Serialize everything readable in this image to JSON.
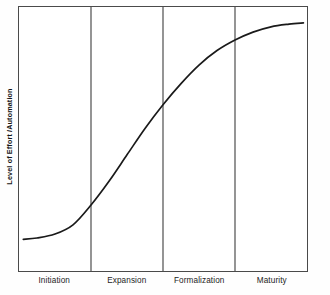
{
  "chart_data": {
    "type": "line",
    "title": "",
    "subtitle": "",
    "xlabel": "",
    "ylabel": "Level of Effort /Automation",
    "grid": false,
    "legend": "none",
    "xlim": [
      0,
      4
    ],
    "ylim": [
      0,
      1
    ],
    "axis_ticks": "none",
    "categories": [
      "Initiation",
      "Expansion",
      "Formalization",
      "Maturity"
    ],
    "stage_boundaries": [
      1,
      2,
      3
    ],
    "annotations": [],
    "series": [
      {
        "name": "Level of Effort /Automation",
        "shape": "s-curve",
        "color": "#1a1a1a",
        "x": [
          0.06,
          0.25,
          0.5,
          0.75,
          1.0,
          1.25,
          1.5,
          1.75,
          2.0,
          2.25,
          2.5,
          2.75,
          3.0,
          3.25,
          3.5,
          3.75,
          3.95
        ],
        "y": [
          0.12,
          0.125,
          0.14,
          0.175,
          0.25,
          0.34,
          0.44,
          0.54,
          0.63,
          0.71,
          0.78,
          0.835,
          0.875,
          0.905,
          0.925,
          0.935,
          0.94
        ]
      }
    ]
  },
  "axes": {
    "ylabel": "Level of Effort /Automation",
    "stages": [
      {
        "label": "Initiation"
      },
      {
        "label": "Expansion"
      },
      {
        "label": "Formalization"
      },
      {
        "label": "Maturity"
      }
    ]
  },
  "colors": {
    "curve": "#1a1a1a",
    "frame": "#4a4a4a",
    "divider": "#5a5a5a",
    "text": "#1a1a1a",
    "background": "#fefefe",
    "plot_background": "#ffffff"
  }
}
